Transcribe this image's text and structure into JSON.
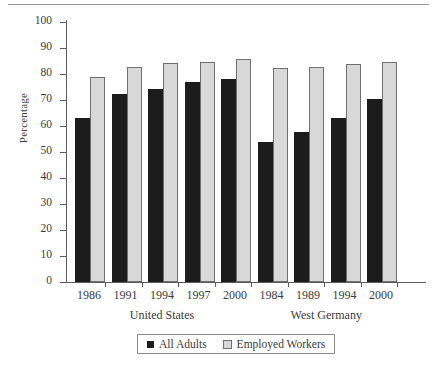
{
  "chart_data": {
    "type": "bar",
    "title": "",
    "xlabel": "",
    "ylabel": "Percentage",
    "ylim": [
      0,
      100
    ],
    "ytick_step": 10,
    "yticks": [
      100,
      90,
      80,
      70,
      60,
      50,
      40,
      30,
      20,
      10,
      0
    ],
    "grid": false,
    "legend_position": "bottom",
    "categories": [
      "1986",
      "1991",
      "1994",
      "1997",
      "2000",
      "1984",
      "1989",
      "1994",
      "2000"
    ],
    "groups": [
      {
        "label": "United States",
        "categories": [
          "1986",
          "1991",
          "1994",
          "1997",
          "2000"
        ]
      },
      {
        "label": "West Germany",
        "categories": [
          "1984",
          "1989",
          "1994",
          "2000"
        ]
      }
    ],
    "series": [
      {
        "name": "All Adults",
        "color": "#1c1c1c",
        "values": [
          62.5,
          71.5,
          73.5,
          76,
          77.5,
          53,
          57,
          62.5,
          69.5
        ]
      },
      {
        "name": "Employed Workers",
        "color": "#d8d8d8",
        "values": [
          78,
          82,
          83.5,
          84,
          85,
          81.5,
          82,
          83,
          84
        ]
      }
    ]
  },
  "legend": {
    "entries": [
      {
        "label": "All Adults",
        "swatch": "dark-square-icon"
      },
      {
        "label": "Employed Workers",
        "swatch": "light-square-icon"
      }
    ]
  }
}
